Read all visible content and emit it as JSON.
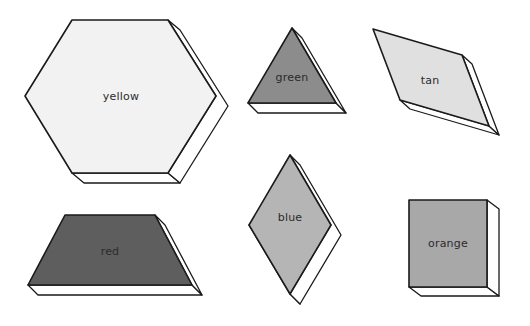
{
  "page": {
    "background_color": "#ffffff",
    "width": 530,
    "height": 326
  },
  "palette": {
    "outline": "#1a1a1a",
    "extrusion_face": "#ffffff",
    "label_text": "#2b2b2b",
    "yellow_fill": "#f2f2f2",
    "green_fill": "#8c8c8c",
    "tan_fill": "#e0e0e0",
    "red_fill": "#5e5e5e",
    "blue_fill": "#b5b5b5",
    "orange_fill": "#a8a8a8"
  },
  "blocks": [
    {
      "name": "hexagon",
      "label": "yellow",
      "fill": "#f2f2f2",
      "top_face": "72,20 168,20 216,96 168,173 72,173 25,96",
      "side_face": "168,20 180,30 228,106 180,183 168,173 216,96",
      "bottom_face": "72,173 168,173 180,183 84,183",
      "label_x": 121,
      "label_y": 97
    },
    {
      "name": "triangle",
      "label": "green",
      "fill": "#8c8c8c",
      "top_face": "292,28 336,103 248,103",
      "side_face": "292,28 302,38 346,113 336,103",
      "bottom_face": "248,103 336,103 346,113 258,113",
      "label_x": 292,
      "label_y": 78
    },
    {
      "name": "thin-rhombus",
      "label": "tan",
      "fill": "#e0e0e0",
      "top_face": "373,29 462,55 489,126 400,100",
      "side_face": "462,55 472,64 499,135 489,126",
      "bottom_face": "400,100 489,126 499,135 410,109",
      "label_x": 430,
      "label_y": 81
    },
    {
      "name": "trapezoid",
      "label": "red",
      "fill": "#5e5e5e",
      "top_face": "65,215 155,215 192,285 28,285",
      "side_face": "155,215 165,225 202,295 192,285",
      "bottom_face": "28,285 192,285 202,295 38,295",
      "label_x": 110,
      "label_y": 252
    },
    {
      "name": "rhombus",
      "label": "blue",
      "fill": "#b5b5b5",
      "top_face": "290,155 331,225 290,294 249,225",
      "side_face": "290,155 300,165 341,235 300,304 290,294 331,225",
      "bottom_face": "290,294 300,304 259,235 249,225",
      "label_x": 290,
      "label_y": 218
    },
    {
      "name": "square",
      "label": "orange",
      "fill": "#a8a8a8",
      "top_face": "409,200 487,200 487,287 409,287",
      "side_face": "487,200 499,209 499,296 487,287",
      "bottom_face": "409,287 487,287 499,296 421,296",
      "label_x": 448,
      "label_y": 244
    }
  ]
}
